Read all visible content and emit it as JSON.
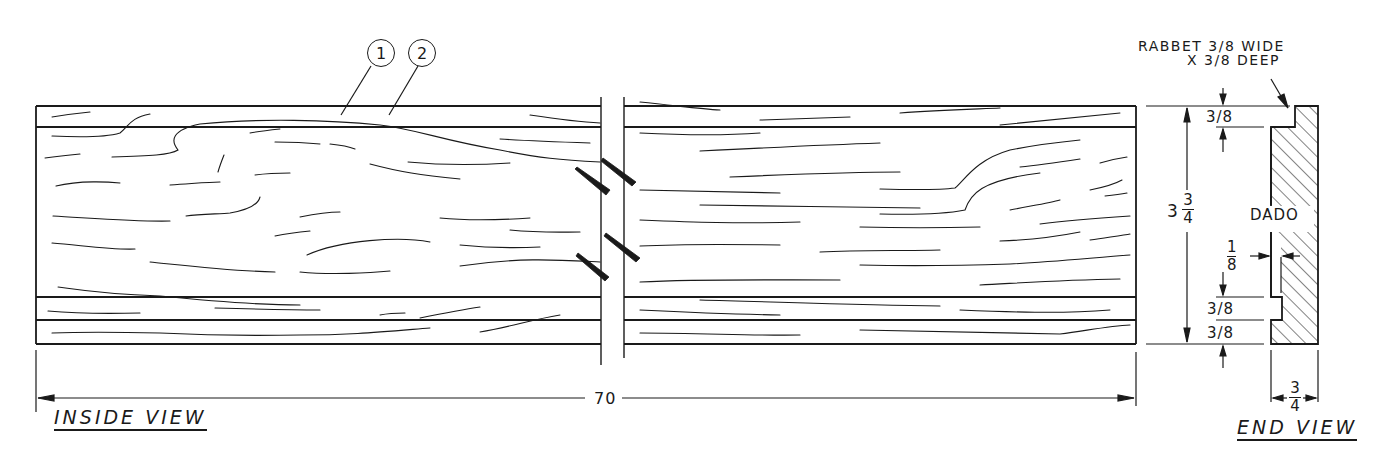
{
  "drawing": {
    "views": {
      "inside": {
        "title": "INSIDE VIEW",
        "length_dim": "70"
      },
      "end": {
        "title": "END VIEW",
        "width_dim": {
          "numerator": "3",
          "denominator": "4"
        }
      }
    },
    "callouts": {
      "part_1": "1",
      "part_2": "2",
      "rabbet_note_line1": "RABBET 3/8 WIDE",
      "rabbet_note_line2": "X 3/8 DEEP",
      "dado_label": "DADO"
    },
    "dimensions": {
      "height": {
        "whole": "3",
        "numerator": "3",
        "denominator": "4"
      },
      "rabbet_top": "3/8",
      "groove_width": "3/8",
      "groove_bottom": "3/8",
      "dado_depth": {
        "numerator": "1",
        "denominator": "8"
      }
    },
    "colors": {
      "ink": "#1a1a1a",
      "paper": "#ffffff"
    }
  }
}
